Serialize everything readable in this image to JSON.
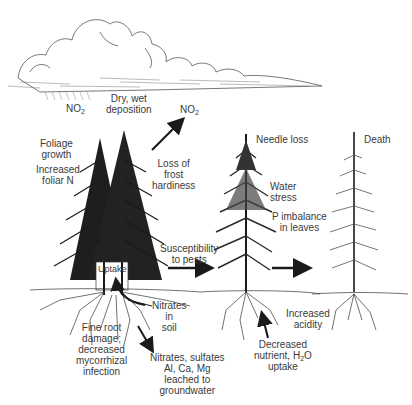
{
  "diagram": {
    "stages": [
      {
        "name": "healthy-trees",
        "description": "Dense spruce pair with roots"
      },
      {
        "name": "declining-tree",
        "description": "Thinning spruce"
      },
      {
        "name": "dead-tree",
        "description": "Bare spruce skeleton"
      }
    ],
    "atmosphere": {
      "no2_left": "NO",
      "no2_left_sub": "2",
      "deposition_line1": "Dry, wet",
      "deposition_line2": "deposition",
      "no2_right": "NO",
      "no2_right_sub": "2"
    },
    "stage1": {
      "foliage_line1": "Foliage",
      "foliage_line2": "growth",
      "foliar_line1": "Increased",
      "foliar_line2": "foliar N",
      "frost_line1": "Loss of",
      "frost_line2": "frost",
      "frost_line3": "hardiness",
      "pests_line1": "Susceptibility",
      "pests_line2": "to pests",
      "uptake": "Uptake",
      "nitrates_line1": "Nitrates",
      "nitrates_line2": "in",
      "nitrates_line3": "soil",
      "root_line1": "Fine root",
      "root_line2": "damage;",
      "root_line3": "decreased",
      "root_line4": "mycorrhizal",
      "root_line5": "infection",
      "leach_line1": "Nitrates, sulfates",
      "leach_line2": "Al, Ca, Mg",
      "leach_line3": "leached to",
      "leach_line4": "groundwater"
    },
    "stage2": {
      "needle": "Needle loss",
      "water_line1": "Water",
      "water_line2": "stress",
      "p_line1": "P imbalance",
      "p_line2": "in leaves",
      "acid_line1": "Increased",
      "acid_line2": "acidity",
      "nutrient_line1": "Decreased",
      "nutrient_line2": "nutrient, H",
      "nutrient_sub": "2",
      "nutrient_tail": "O",
      "nutrient_line3": "uptake"
    },
    "stage3": {
      "death": "Death"
    },
    "colors": {
      "ink": "#1a1a1a",
      "text": "#3a3a3a",
      "background": "#ffffff"
    }
  }
}
